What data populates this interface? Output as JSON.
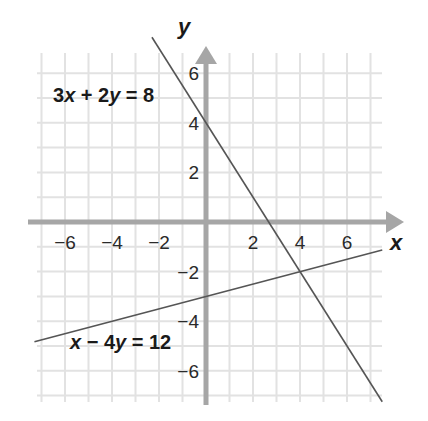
{
  "chart_data": {
    "type": "line",
    "title": "",
    "xlabel": "x",
    "ylabel": "y",
    "xlim": [
      -7.3,
      7.5
    ],
    "ylim": [
      -7.5,
      7.0
    ],
    "grid": true,
    "x_ticks": [
      -6,
      -4,
      -2,
      2,
      4,
      6
    ],
    "y_ticks": [
      6,
      4,
      2,
      -2,
      -4,
      -6
    ],
    "series": [
      {
        "name": "3x + 2y = 8",
        "equation": "3x + 2y = 8",
        "slope": -1.5,
        "intercept": 4,
        "x_range": [
          -2.3,
          7.5
        ],
        "points": [
          [
            -2.3,
            7.45
          ],
          [
            7.5,
            -7.25
          ]
        ]
      },
      {
        "name": "x − 4y = 12",
        "equation": "x − 4y = 12",
        "slope": 0.25,
        "intercept": -3,
        "x_range": [
          -7.3,
          7.5
        ],
        "points": [
          [
            -7.3,
            -4.825
          ],
          [
            7.5,
            -1.125
          ]
        ]
      }
    ],
    "intersection": [
      4,
      -2
    ],
    "annotations": [
      {
        "text": "3x + 2y = 8",
        "label_for": "3x + 2y = 8"
      },
      {
        "text": "x − 4y = 12",
        "label_for": "x − 4y = 12"
      }
    ]
  },
  "labels": {
    "x_axis": "x",
    "y_axis": "y",
    "eq1": {
      "a": "3",
      "v1": "x",
      "op": " + 2",
      "v2": "y",
      "rhs": " = 8"
    },
    "eq2": {
      "v1": "x",
      "op": " − 4",
      "v2": "y",
      "rhs": " = 12"
    }
  },
  "colors": {
    "grid": "#e2e2e2",
    "axis": "#a6a6a6",
    "line": "#555555",
    "text": "#1a1a1a"
  }
}
